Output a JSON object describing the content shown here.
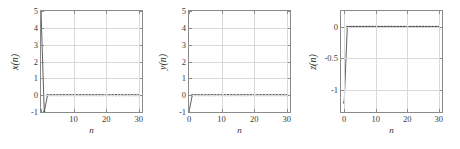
{
  "figure": {
    "title": "",
    "panel_count": 3
  },
  "chart_data": [
    {
      "type": "line",
      "title": "",
      "xlabel": "n",
      "ylabel": "x(n)",
      "xlim": [
        0,
        31
      ],
      "ylim": [
        -1,
        5
      ],
      "xticks": [
        0,
        10,
        20,
        30
      ],
      "xticklabels": [
        "",
        "10",
        "20",
        "30"
      ],
      "yticks": [
        -1,
        0,
        1,
        2,
        3,
        4,
        5
      ],
      "yticklabels": [
        "-1",
        "0",
        "1",
        "2",
        "3",
        "4",
        "5"
      ],
      "grid": true,
      "legend": "none",
      "marker": "dot",
      "x": [
        0,
        1,
        2,
        3,
        4,
        5,
        6,
        7,
        8,
        9,
        10,
        11,
        12,
        13,
        14,
        15,
        16,
        17,
        18,
        19,
        20,
        21,
        22,
        23,
        24,
        25,
        26,
        27,
        28,
        29,
        30
      ],
      "values": [
        5,
        -1,
        0,
        0,
        0,
        0,
        0,
        0,
        0,
        0,
        0,
        0,
        0,
        0,
        0,
        0,
        0,
        0,
        0,
        0,
        0,
        0,
        0,
        0,
        0,
        0,
        0,
        0,
        0,
        0,
        0
      ]
    },
    {
      "type": "line",
      "title": "",
      "xlabel": "n",
      "ylabel": "y(n)",
      "xlim": [
        0,
        31
      ],
      "ylim": [
        -1,
        5
      ],
      "xticks": [
        0,
        10,
        20,
        30
      ],
      "xticklabels": [
        "0",
        "10",
        "20",
        "30"
      ],
      "yticks": [
        -1,
        0,
        1,
        2,
        3,
        4,
        5
      ],
      "yticklabels": [
        "-1",
        "0",
        "1",
        "2",
        "3",
        "4",
        "5"
      ],
      "grid": true,
      "legend": "none",
      "marker": "dot",
      "x": [
        0,
        1,
        2,
        3,
        4,
        5,
        6,
        7,
        8,
        9,
        10,
        11,
        12,
        13,
        14,
        15,
        16,
        17,
        18,
        19,
        20,
        21,
        22,
        23,
        24,
        25,
        26,
        27,
        28,
        29,
        30
      ],
      "values": [
        -1,
        0,
        0,
        0,
        0,
        0,
        0,
        0,
        0,
        0,
        0,
        0,
        0,
        0,
        0,
        0,
        0,
        0,
        0,
        0,
        0,
        0,
        0,
        0,
        0,
        0,
        0,
        0,
        0,
        0,
        0
      ]
    },
    {
      "type": "line",
      "title": "",
      "xlabel": "n",
      "ylabel": "z(n)",
      "xlim": [
        -1,
        31
      ],
      "ylim": [
        -1.35,
        0.25
      ],
      "xticks": [
        0,
        10,
        20,
        30
      ],
      "xticklabels": [
        "0",
        "10",
        "20",
        "30"
      ],
      "yticks": [
        -1,
        -0.5,
        0
      ],
      "yticklabels": [
        "-1",
        "-0.5",
        "0"
      ],
      "grid": true,
      "legend": "none",
      "marker": "dot",
      "x": [
        0,
        1,
        2,
        3,
        4,
        5,
        6,
        7,
        8,
        9,
        10,
        11,
        12,
        13,
        14,
        15,
        16,
        17,
        18,
        19,
        20,
        21,
        22,
        23,
        24,
        25,
        26,
        27,
        28,
        29,
        30
      ],
      "values": [
        -1.2,
        0,
        0,
        0,
        0,
        0,
        0,
        0,
        0,
        0,
        0,
        0,
        0,
        0,
        0,
        0,
        0,
        0,
        0,
        0,
        0,
        0,
        0,
        0,
        0,
        0,
        0,
        0,
        0,
        0,
        0
      ]
    }
  ],
  "colors": {
    "line": "#4d4d4d",
    "axis": "#8a8a8a",
    "grid": "#d9d9d9",
    "text": "#3a3a3a",
    "background": "#ffffff"
  }
}
